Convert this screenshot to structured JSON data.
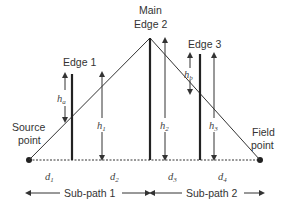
{
  "diagram": {
    "type": "multiple knife-edge diffraction geometry",
    "labels": {
      "main_edge_line1": "Main",
      "main_edge_line2": "Edge 2",
      "edge1": "Edge 1",
      "edge3": "Edge 3",
      "source_line1": "Source",
      "source_line2": "point",
      "field_line1": "Field",
      "field_line2": "point"
    },
    "heights": {
      "ha": "h",
      "ha_sub": "a",
      "hb": "h",
      "hb_sub": "b",
      "h1": "h",
      "h1_sub": "1",
      "h2": "h",
      "h2_sub": "2",
      "h3": "h",
      "h3_sub": "3"
    },
    "distances": {
      "d1": "d",
      "d1_sub": "1",
      "d2": "d",
      "d2_sub": "2",
      "d3": "d",
      "d3_sub": "3",
      "d4": "d",
      "d4_sub": "4"
    },
    "subpaths": {
      "sp1": "Sub-path 1",
      "sp2": "Sub-path 2"
    },
    "colors": {
      "line": "#333333",
      "text": "#333333"
    }
  }
}
